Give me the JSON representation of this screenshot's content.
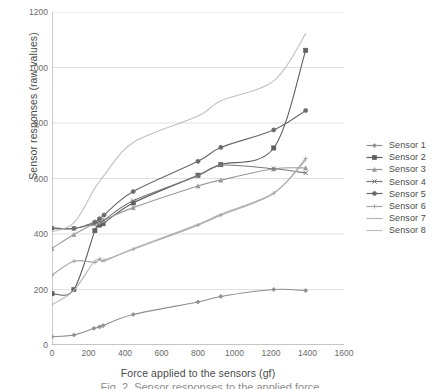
{
  "chart_data": {
    "type": "line",
    "title": "",
    "xlabel": "Force applied to the sensors (gf)",
    "ylabel": "Sensor responses (raw values)",
    "xlim": [
      0,
      1600
    ],
    "ylim": [
      0,
      1200
    ],
    "xticks": [
      0,
      200,
      400,
      600,
      800,
      1000,
      1200,
      1400,
      1600
    ],
    "yticks": [
      0,
      200,
      400,
      600,
      800,
      1000,
      1200
    ],
    "ytick_labels": [
      "0",
      "200",
      "400",
      "600",
      "800",
      "1000",
      "1200"
    ],
    "grid": "horizontal",
    "legend_position": "right",
    "series": [
      {
        "name": "Sensor 1",
        "color": "#8f8f8f",
        "marker": "diamond",
        "x": [
          0,
          120,
          230,
          260,
          280,
          445,
          800,
          925,
          1215,
          1390
        ],
        "y": [
          30,
          36,
          60,
          65,
          70,
          110,
          155,
          175,
          200,
          196
        ]
      },
      {
        "name": "Sensor 2",
        "color": "#5f5f5f",
        "marker": "square",
        "x": [
          0,
          120,
          235,
          260,
          280,
          445,
          800,
          925,
          1215,
          1390
        ],
        "y": [
          185,
          200,
          412,
          432,
          437,
          512,
          612,
          650,
          710,
          1062
        ]
      },
      {
        "name": "Sensor 3",
        "color": "#9a9a9a",
        "marker": "triangle",
        "x": [
          0,
          120,
          230,
          255,
          280,
          445,
          800,
          925,
          1215,
          1390
        ],
        "y": [
          348,
          398,
          437,
          443,
          449,
          495,
          573,
          594,
          635,
          638
        ]
      },
      {
        "name": "Sensor 4",
        "color": "#7a7a7a",
        "marker": "cross",
        "x": [
          0,
          120,
          230,
          260,
          285,
          445,
          800,
          925,
          1215,
          1390
        ],
        "y": [
          422,
          420,
          437,
          445,
          450,
          520,
          610,
          648,
          635,
          620
        ]
      },
      {
        "name": "Sensor 5",
        "color": "#6b6b6b",
        "marker": "circle",
        "x": [
          0,
          120,
          235,
          260,
          285,
          445,
          800,
          925,
          1215,
          1390
        ],
        "y": [
          420,
          420,
          443,
          455,
          468,
          553,
          662,
          712,
          775,
          845
        ]
      },
      {
        "name": "Sensor 6",
        "color": "#a5a5a5",
        "marker": "plus",
        "x": [
          0,
          120,
          235,
          262,
          285,
          445,
          800,
          925,
          1215,
          1390
        ],
        "y": [
          252,
          302,
          298,
          310,
          305,
          345,
          432,
          468,
          547,
          672
        ]
      },
      {
        "name": "Sensor 7",
        "color": "#b5b5b5",
        "marker": "none",
        "x": [
          0,
          120,
          230,
          265,
          290,
          445,
          800,
          925,
          1215,
          1390
        ],
        "y": [
          145,
          197,
          300,
          305,
          303,
          347,
          435,
          472,
          548,
          665
        ]
      },
      {
        "name": "Sensor 8",
        "color": "#c0c0c0",
        "marker": "none",
        "x": [
          0,
          120,
          230,
          262,
          290,
          445,
          800,
          925,
          1215,
          1390
        ],
        "y": [
          408,
          440,
          560,
          590,
          615,
          730,
          825,
          880,
          952,
          1122
        ]
      }
    ]
  },
  "legend": {
    "items": [
      {
        "label": "Sensor 1"
      },
      {
        "label": "Sensor 2"
      },
      {
        "label": "Sensor 3"
      },
      {
        "label": "Sensor 4"
      },
      {
        "label": "Sensor 5"
      },
      {
        "label": "Sensor 6"
      },
      {
        "label": "Sensor 7"
      },
      {
        "label": "Sensor 8"
      }
    ]
  },
  "caption": {
    "text": "Fig. 2. Sensor responses to the applied force"
  },
  "axes": {
    "xlabel": "Force applied to the sensors (gf)",
    "ylabel": "Sensor responses (raw values)"
  },
  "colors": {
    "grid": "#d9d9d9",
    "axis": "#9c9c9c",
    "text": "#4a4a4a"
  }
}
